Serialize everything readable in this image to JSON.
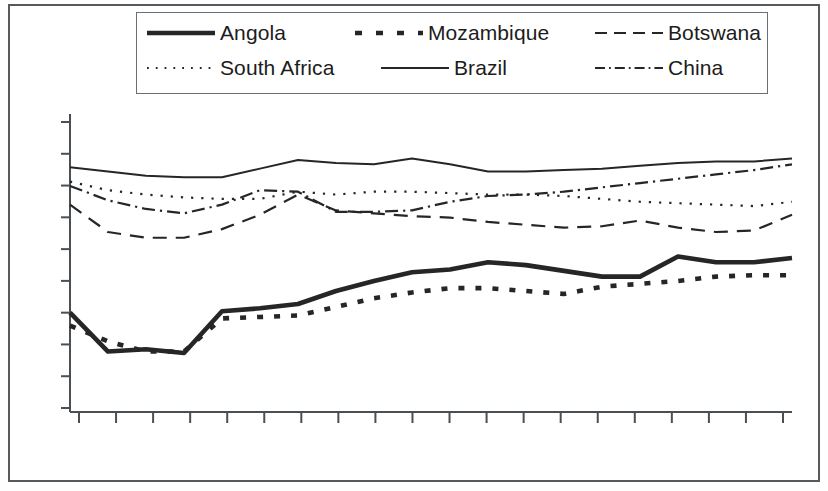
{
  "figure": {
    "kind": "line-chart",
    "frame_border_color": "#555a5e",
    "background_color": "#ffffff",
    "line_color": "#262626"
  },
  "legend": {
    "position": "top-center",
    "border": true,
    "entries": [
      {
        "label": "Angola",
        "style": "solid-thick",
        "sample": "angola-line-sample"
      },
      {
        "label": "Mozambique",
        "style": "dotted-thick",
        "sample": "mozambique-line-sample"
      },
      {
        "label": "Botswana",
        "style": "dashed",
        "sample": "botswana-line-sample"
      },
      {
        "label": "South Africa",
        "style": "dotted-fine",
        "sample": "south-africa-line-sample"
      },
      {
        "label": "Brazil",
        "style": "solid-thin",
        "sample": "brazil-line-sample"
      },
      {
        "label": "China",
        "style": "dash-dot",
        "sample": "china-line-sample"
      }
    ]
  },
  "axes": {
    "x_tick_count": 20,
    "y_tick_count": 10,
    "x_tick_labels": [],
    "y_tick_labels": [],
    "grid": false,
    "xlabel": "",
    "ylabel": "",
    "title": ""
  },
  "chart_data": {
    "type": "line",
    "title": "",
    "subtitle": "",
    "xlabel": "",
    "ylabel": "",
    "grid": false,
    "legend_position": "top-center",
    "x": [
      1,
      2,
      3,
      4,
      5,
      6,
      7,
      8,
      9,
      10,
      11,
      12,
      13,
      14,
      15,
      16,
      17,
      18,
      19,
      20
    ],
    "x_tick_labels": [],
    "y_tick_labels": [],
    "xlim": [
      1,
      20
    ],
    "ylim": [
      0,
      100
    ],
    "series": [
      {
        "name": "Angola",
        "style": "solid-thick",
        "values": [
          34.5,
          21.0,
          21.8,
          20.5,
          35.0,
          36.0,
          37.5,
          42.0,
          45.5,
          48.5,
          49.5,
          52.0,
          51.0,
          49.0,
          47.0,
          47.0,
          54.0,
          52.0,
          52.0,
          53.5
        ]
      },
      {
        "name": "Mozambique",
        "style": "dotted-thick",
        "values": [
          30.0,
          24.5,
          21.0,
          21.0,
          32.5,
          33.0,
          33.5,
          36.5,
          39.5,
          41.5,
          43.0,
          43.0,
          42.0,
          41.0,
          43.5,
          44.5,
          45.5,
          47.0,
          47.5,
          47.5
        ]
      },
      {
        "name": "Botswana",
        "style": "dashed",
        "values": [
          72.0,
          62.5,
          60.5,
          60.5,
          63.5,
          68.5,
          75.5,
          70.0,
          69.0,
          68.0,
          67.5,
          66.0,
          65.0,
          64.0,
          64.5,
          66.5,
          64.0,
          62.5,
          63.0,
          68.5
        ]
      },
      {
        "name": "South Africa",
        "style": "dotted-fine",
        "values": [
          80.0,
          77.0,
          75.5,
          74.5,
          74.0,
          74.0,
          76.5,
          75.5,
          76.5,
          76.5,
          76.0,
          75.5,
          75.5,
          75.0,
          74.0,
          73.0,
          72.5,
          72.0,
          71.5,
          73.0
        ]
      },
      {
        "name": "Brazil",
        "style": "solid-thin",
        "values": [
          85.0,
          83.5,
          82.0,
          81.5,
          81.5,
          84.5,
          87.5,
          86.5,
          86.0,
          88.0,
          86.0,
          83.5,
          83.5,
          84.0,
          84.5,
          85.5,
          86.5,
          87.0,
          87.0,
          88.0
        ]
      },
      {
        "name": "China",
        "style": "dash-dot",
        "values": [
          78.5,
          73.5,
          70.5,
          69.0,
          72.0,
          77.0,
          76.5,
          69.5,
          69.5,
          70.0,
          73.0,
          75.0,
          75.5,
          76.5,
          78.0,
          79.5,
          81.0,
          82.5,
          84.0,
          86.0
        ]
      }
    ]
  }
}
